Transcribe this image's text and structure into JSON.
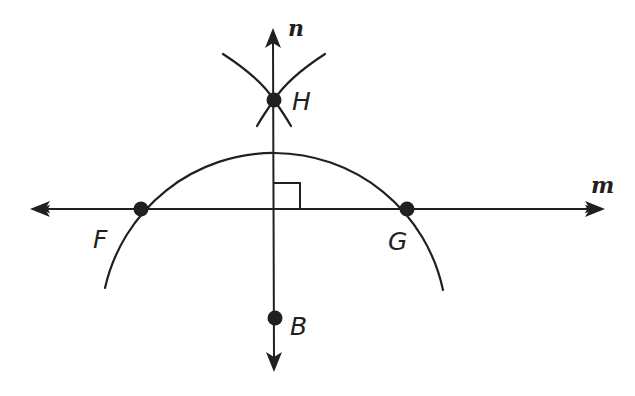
{
  "diagram": {
    "lines": {
      "horizontal": {
        "label": "m",
        "y": 209,
        "x1": 30,
        "x2": 605
      },
      "vertical": {
        "label": "n",
        "x": 273,
        "y1": 28,
        "y2": 372
      }
    },
    "points": [
      {
        "id": "F",
        "label": "F",
        "x": 141,
        "y": 209
      },
      {
        "id": "G",
        "label": "G",
        "x": 407,
        "y": 209
      },
      {
        "id": "H",
        "label": "H",
        "x": 274,
        "y": 100
      },
      {
        "id": "B",
        "label": "B",
        "x": 275,
        "y": 318
      }
    ],
    "right_angle_marker": {
      "at": "intersection of m and n",
      "size": 26
    },
    "arcs": [
      {
        "name": "arc-centered-B",
        "center": "B",
        "through": [
          "F",
          "G"
        ]
      },
      {
        "name": "arc-centered-G",
        "center": "G",
        "through": [
          "H"
        ]
      },
      {
        "name": "arc-centered-F",
        "center": "F",
        "through": [
          "H"
        ]
      }
    ],
    "colors": {
      "ink": "#231f20",
      "background": "#ffffff"
    }
  }
}
